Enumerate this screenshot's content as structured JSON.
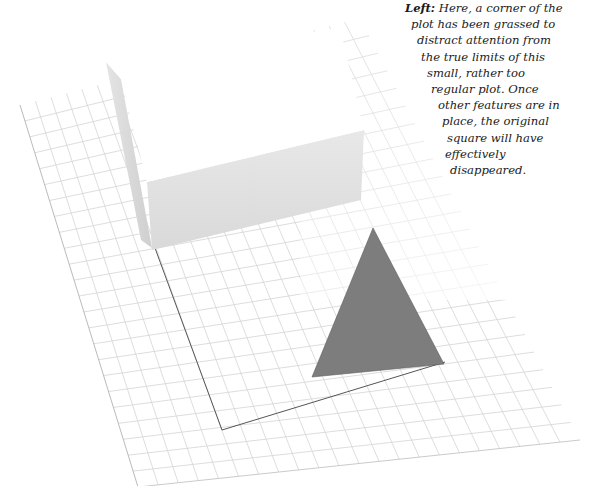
{
  "caption": {
    "lead": "Left:",
    "lines": [
      {
        "text": " Here, a corner of the",
        "x": 0
      },
      {
        "text": "plot has been grassed to",
        "x": 6
      },
      {
        "text": "distract attention from",
        "x": 12
      },
      {
        "text": "the true limits of this",
        "x": 16
      },
      {
        "text": "small, rather too",
        "x": 22
      },
      {
        "text": "regular plot. Once",
        "x": 26
      },
      {
        "text": "other features are in",
        "x": 33
      },
      {
        "text": "place, the original",
        "x": 37
      },
      {
        "text": "square will have",
        "x": 42
      },
      {
        "text": "effectively",
        "x": 40
      },
      {
        "text": "disappeared.",
        "x": 45
      }
    ]
  },
  "diagram": {
    "colors": {
      "grid_line": "#d4d4d4",
      "paper": "#ffffff",
      "paper_edge": "#9a9a9a",
      "box_top": "#ffffff",
      "box_front": "#e2e2e2",
      "box_side": "#d6d6d6",
      "plot_outline": "#555555",
      "grass_triangle": "#7d7d7d"
    },
    "paper": {
      "tl": [
        20,
        105
      ],
      "tr": [
        360,
        18
      ],
      "br": [
        580,
        440
      ],
      "bl": [
        138,
        487
      ],
      "cols": 22,
      "rows": 24
    },
    "plot_outline": [
      [
        155,
        248
      ],
      [
        222,
        430
      ],
      [
        445,
        362
      ]
    ],
    "grass_triangle": [
      [
        373,
        228
      ],
      [
        312,
        377
      ],
      [
        444,
        364
      ]
    ],
    "box": {
      "side_face": [
        [
          106,
          62
        ],
        [
          121,
          79
        ],
        [
          152,
          248
        ],
        [
          141,
          240
        ]
      ],
      "top_face": [
        [
          106,
          62
        ],
        [
          340,
          28
        ],
        [
          364,
          130
        ],
        [
          147,
          182
        ],
        [
          121,
          79
        ]
      ],
      "front_face": [
        [
          147,
          182
        ],
        [
          364,
          130
        ],
        [
          361,
          200
        ],
        [
          152,
          250
        ]
      ]
    }
  }
}
